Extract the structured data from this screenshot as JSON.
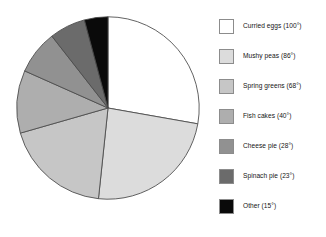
{
  "chart_data": {
    "type": "pie",
    "title": "",
    "subtitle": "",
    "xlabel": "",
    "ylabel": "",
    "units": "degrees",
    "total_degrees": 360,
    "start_angle_deg": 0,
    "direction": "clockwise",
    "legend_position": "right",
    "grid": false,
    "categories": [
      "Curried eggs",
      "Mushy peas",
      "Spring greens",
      "Fish cakes",
      "Cheese pie",
      "Spinach pie",
      "Other"
    ],
    "values": [
      100,
      86,
      68,
      40,
      28,
      23,
      15
    ],
    "colors": [
      "#ffffff",
      "#dcdcdc",
      "#c6c6c6",
      "#aeaeae",
      "#919191",
      "#6b6b6b",
      "#0a0a0a"
    ],
    "slices": [
      {
        "label": "Curried eggs",
        "value": 100,
        "label_text": "Curried eggs (100°)",
        "color": "#ffffff"
      },
      {
        "label": "Mushy peas",
        "value": 86,
        "label_text": "Mushy peas (86°)",
        "color": "#dcdcdc"
      },
      {
        "label": "Spring greens",
        "value": 68,
        "label_text": "Spring greens (68°)",
        "color": "#c6c6c6"
      },
      {
        "label": "Fish cakes",
        "value": 40,
        "label_text": "Fish cakes (40°)",
        "color": "#aeaeae"
      },
      {
        "label": "Cheese pie",
        "value": 28,
        "label_text": "Cheese pie (28°)",
        "color": "#919191"
      },
      {
        "label": "Spinach pie",
        "value": 23,
        "label_text": "Spinach pie (23°)",
        "color": "#6b6b6b"
      },
      {
        "label": "Other",
        "value": 15,
        "label_text": "Other (15°)",
        "color": "#0a0a0a"
      }
    ],
    "outline_color": "#4a4a4a",
    "background_color": "#ffffff"
  }
}
